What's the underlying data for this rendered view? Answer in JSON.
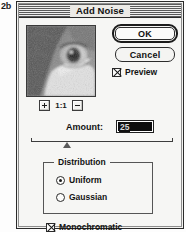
{
  "figure": {
    "label": "2b"
  },
  "dialog": {
    "title": "Add Noise"
  },
  "preview": {
    "zoom_out_icon": "minus-icon",
    "zoom_in_icon": "plus-icon",
    "zoom_level": "1:1"
  },
  "buttons": {
    "ok": "OK",
    "cancel": "Cancel"
  },
  "options": {
    "preview_label": "Preview",
    "preview_checked": true,
    "monochromatic_label": "Monochromatic",
    "monochromatic_checked": true
  },
  "amount": {
    "label": "Amount:",
    "value": "25",
    "slider_percent": 25
  },
  "distribution": {
    "title": "Distribution",
    "options": [
      {
        "label": "Uniform",
        "selected": true
      },
      {
        "label": "Gaussian",
        "selected": false
      }
    ]
  },
  "colors": {
    "dialog_bg": "#f6f6f4",
    "border": "#2b2b2b",
    "text": "#121212",
    "field_selection": "#0d0d0d"
  }
}
